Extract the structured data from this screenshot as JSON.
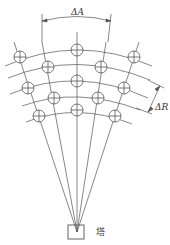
{
  "diagram": {
    "labels": {
      "azimuth_spacing": "ΔA",
      "range_spacing": "ΔR",
      "tower": "塔"
    },
    "colors": {
      "line": "#555555",
      "background": "#ffffff"
    },
    "grid": {
      "beams": 5,
      "range_arcs": 5,
      "cells": [
        {
          "row": 1,
          "x": 20,
          "y": 57
        },
        {
          "row": 1,
          "x": 77,
          "y": 50
        },
        {
          "row": 1,
          "x": 134,
          "y": 57
        },
        {
          "row": 2,
          "x": 48,
          "y": 67
        },
        {
          "row": 2,
          "x": 101,
          "y": 67
        },
        {
          "row": 3,
          "x": 28,
          "y": 88
        },
        {
          "row": 3,
          "x": 77,
          "y": 81
        },
        {
          "row": 3,
          "x": 124,
          "y": 88
        },
        {
          "row": 4,
          "x": 54,
          "y": 98
        },
        {
          "row": 4,
          "x": 98,
          "y": 98
        },
        {
          "row": 5,
          "x": 39,
          "y": 116
        },
        {
          "row": 5,
          "x": 77,
          "y": 110
        },
        {
          "row": 5,
          "x": 115,
          "y": 116
        }
      ]
    }
  }
}
